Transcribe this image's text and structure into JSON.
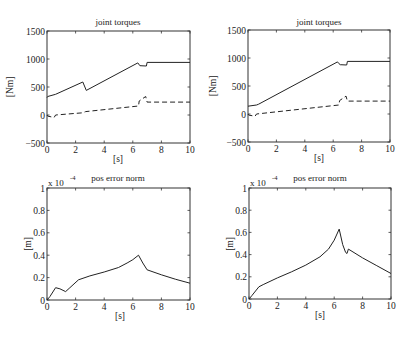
{
  "chart_data": [
    {
      "type": "line",
      "panel": "top-left",
      "title": "joint torques",
      "xlabel": "[s]",
      "ylabel": "[Nm]",
      "xlim": [
        0,
        10
      ],
      "ylim": [
        -500,
        1500
      ],
      "xticks": [
        0,
        2,
        4,
        6,
        8,
        10
      ],
      "yticks": [
        -500,
        0,
        500,
        1000,
        1500
      ],
      "grid": false,
      "series": [
        {
          "name": "joint 1 torque",
          "style": "solid",
          "x": [
            0,
            0.05,
            0.6,
            2.5,
            2.75,
            6.35,
            6.5,
            6.95,
            7.0,
            10
          ],
          "y": [
            310,
            330,
            370,
            590,
            440,
            930,
            880,
            875,
            940,
            940
          ]
        },
        {
          "name": "joint 2 torque",
          "style": "dashed",
          "x": [
            0,
            0.05,
            0.5,
            0.6,
            2.5,
            2.7,
            6.4,
            6.45,
            6.9,
            7.0,
            10
          ],
          "y": [
            0,
            -20,
            -45,
            0,
            40,
            60,
            160,
            250,
            330,
            230,
            230
          ]
        }
      ]
    },
    {
      "type": "line",
      "panel": "top-right",
      "title": "joint torques",
      "xlabel": "[s]",
      "ylabel": "[Nm]",
      "xlim": [
        0,
        10
      ],
      "ylim": [
        -500,
        1500
      ],
      "xticks": [
        0,
        2,
        4,
        6,
        8,
        10
      ],
      "yticks": [
        -500,
        0,
        500,
        1000,
        1500
      ],
      "grid": false,
      "series": [
        {
          "name": "joint 1 torque",
          "style": "solid",
          "x": [
            0,
            0.6,
            0.75,
            6.3,
            6.4,
            6.5,
            6.95,
            7.0,
            10
          ],
          "y": [
            140,
            160,
            175,
            930,
            900,
            880,
            875,
            940,
            940
          ]
        },
        {
          "name": "joint 2 torque",
          "style": "dashed",
          "x": [
            0,
            0.05,
            0.5,
            0.6,
            6.4,
            6.45,
            6.9,
            7.0,
            10
          ],
          "y": [
            0,
            -20,
            -40,
            0,
            160,
            240,
            320,
            230,
            230
          ]
        }
      ]
    },
    {
      "type": "line",
      "panel": "bottom-left",
      "title": "pos error norm",
      "xlabel": "[s]",
      "ylabel": "[m]",
      "scale_annotation": "x 10^-4",
      "xlim": [
        0,
        10
      ],
      "ylim": [
        0,
        1
      ],
      "xticks": [
        0,
        2,
        4,
        6,
        8,
        10
      ],
      "yticks": [
        0,
        0.2,
        0.4,
        0.6,
        0.8,
        1
      ],
      "grid": false,
      "series": [
        {
          "name": "position error norm",
          "style": "solid",
          "x": [
            0,
            0.2,
            0.6,
            0.9,
            1.3,
            1.6,
            2.2,
            3,
            4,
            5,
            5.6,
            6.0,
            6.4,
            6.7,
            7.0,
            8,
            9,
            10
          ],
          "y": [
            0,
            0.03,
            0.11,
            0.1,
            0.075,
            0.11,
            0.18,
            0.215,
            0.25,
            0.29,
            0.33,
            0.36,
            0.4,
            0.33,
            0.27,
            0.225,
            0.185,
            0.15
          ]
        }
      ]
    },
    {
      "type": "line",
      "panel": "bottom-right",
      "title": "pos error norm",
      "xlabel": "[s]",
      "ylabel": "[m]",
      "scale_annotation": "x 10^-4",
      "xlim": [
        0,
        10
      ],
      "ylim": [
        0,
        1
      ],
      "xticks": [
        0,
        2,
        4,
        6,
        8,
        10
      ],
      "yticks": [
        0,
        0.2,
        0.4,
        0.6,
        0.8,
        1
      ],
      "grid": false,
      "series": [
        {
          "name": "position error norm",
          "style": "solid",
          "x": [
            0,
            0.2,
            0.7,
            1,
            2,
            3,
            4,
            5,
            5.6,
            6.0,
            6.35,
            6.6,
            6.8,
            6.9,
            7.0,
            8,
            9,
            10
          ],
          "y": [
            0,
            0.03,
            0.11,
            0.13,
            0.19,
            0.245,
            0.305,
            0.38,
            0.45,
            0.53,
            0.63,
            0.49,
            0.42,
            0.41,
            0.45,
            0.37,
            0.3,
            0.23
          ]
        }
      ]
    }
  ],
  "panels": {
    "top_left": {
      "title": "joint torques",
      "xlabel": "[s]",
      "ylabel": "[Nm]"
    },
    "top_right": {
      "title": "joint torques",
      "xlabel": "[s]",
      "ylabel": "[Nm]"
    },
    "bottom_left": {
      "title": "pos error norm",
      "xlabel": "[s]",
      "ylabel": "[m]",
      "scale": "x 10",
      "scale_exp": "-4"
    },
    "bottom_right": {
      "title": "pos error norm",
      "xlabel": "[s]",
      "ylabel": "[m]",
      "scale": "x 10",
      "scale_exp": "-4"
    }
  }
}
